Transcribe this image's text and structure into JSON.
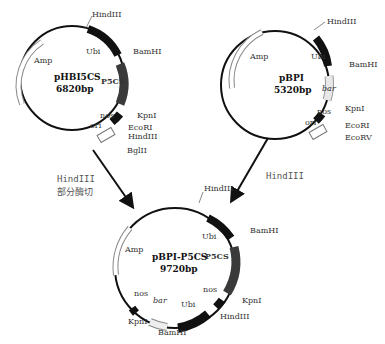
{
  "plasmids": [
    {
      "name": "pHBI5CS",
      "size": "6820bp",
      "features": {
        "amp": "Amp",
        "ubi": "Ubi",
        "p5cs": "P5CS",
        "nos": "nos",
        "ori": "ori"
      },
      "sites": {
        "hind_top": "HindIII",
        "bamhi": "BamHI",
        "kpni": "KpnI",
        "ecori": "EcoRI",
        "hind_bottom": "HindIII",
        "bglii": "BglII"
      }
    },
    {
      "name": "pBPI",
      "size": "5320bp",
      "features": {
        "amp": "Amp",
        "ubi": "Ubi",
        "bar": "bar",
        "nos": "nos",
        "ori": "ori"
      },
      "sites": {
        "hind_top": "HindIII",
        "bamhi": "BamHI",
        "kpni": "KpnI",
        "ecori": "EcoRI",
        "ecorv": "EcoRV"
      }
    },
    {
      "name": "pBPI-P5CS",
      "size": "9720bp",
      "features": {
        "amp": "Amp",
        "ubi": "Ubi",
        "p5cs": "P5CS",
        "nos": "nos",
        "nos2": "nos",
        "ubi2": "Ubi",
        "bar": "bar"
      },
      "sites": {
        "hind_top": "HindIII",
        "bamhi": "BamHI",
        "kpni": "KpnI",
        "hind_bottom": "HindIII",
        "bamhi2": "BamHI",
        "kpni2": "KpnI"
      }
    }
  ],
  "annotations": {
    "left_line1": "HindIII",
    "left_line2": "部分酶切",
    "right": "HindIII"
  },
  "colors": {
    "line": "#111111",
    "p5cs": "#3a3a3a",
    "bar": "#e8e8e8",
    "text": "#333333"
  }
}
